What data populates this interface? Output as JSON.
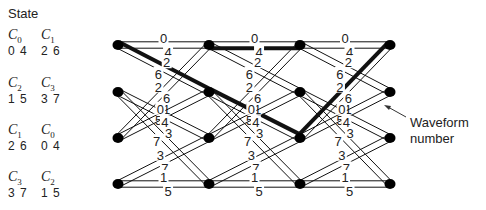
{
  "title": "State",
  "states": [
    {
      "left": {
        "sym": "C",
        "sub": "0",
        "nums": "0 4"
      },
      "right": {
        "sym": "C",
        "sub": "1",
        "nums": "2 6"
      }
    },
    {
      "left": {
        "sym": "C",
        "sub": "2",
        "nums": "1 5"
      },
      "right": {
        "sym": "C",
        "sub": "3",
        "nums": "3 7"
      }
    },
    {
      "left": {
        "sym": "C",
        "sub": "1",
        "nums": "2 6"
      },
      "right": {
        "sym": "C",
        "sub": "0",
        "nums": "0 4"
      }
    },
    {
      "left": {
        "sym": "C",
        "sub": "3",
        "nums": "3 7"
      },
      "right": {
        "sym": "C",
        "sub": "2",
        "nums": "1 5"
      }
    }
  ],
  "annotation": {
    "line1": "Waveform",
    "line2": "number"
  },
  "trellis": {
    "columns_x": [
      118,
      209,
      300,
      390
    ],
    "rows_y": [
      45,
      92,
      138,
      184
    ],
    "transitions": [
      {
        "from": 0,
        "to": 0,
        "labels": [
          "0",
          "4"
        ]
      },
      {
        "from": 0,
        "to": 1,
        "labels": [
          "2",
          "6"
        ]
      },
      {
        "from": 1,
        "to": 2,
        "labels": [
          "1",
          "5"
        ]
      },
      {
        "from": 1,
        "to": 3,
        "labels": [
          "3",
          "7"
        ]
      },
      {
        "from": 2,
        "to": 0,
        "labels": [
          "2",
          "6"
        ]
      },
      {
        "from": 2,
        "to": 1,
        "labels": [
          "0",
          "4"
        ]
      },
      {
        "from": 3,
        "to": 2,
        "labels": [
          "3",
          "7"
        ]
      },
      {
        "from": 3,
        "to": 3,
        "labels": [
          "1",
          "5"
        ]
      }
    ],
    "highlighted_path": [
      {
        "stage": 0,
        "from": 0,
        "to": 1,
        "label": "2"
      },
      {
        "stage": 1,
        "from": 1,
        "to": 2,
        "label": "1"
      },
      {
        "stage": 2,
        "from": 2,
        "to": 0,
        "label": "2"
      },
      {
        "stage": 1,
        "from": 0,
        "to": 0,
        "label": "4"
      }
    ]
  }
}
